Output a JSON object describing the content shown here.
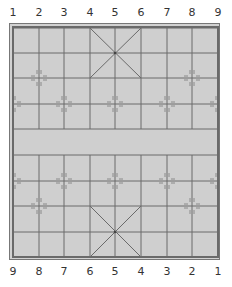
{
  "board": {
    "type": "xiangqi",
    "columns": 9,
    "rows": 10,
    "top_file_labels": [
      "1",
      "2",
      "3",
      "4",
      "5",
      "6",
      "7",
      "8",
      "9"
    ],
    "bottom_file_labels": [
      "9",
      "8",
      "7",
      "6",
      "5",
      "4",
      "3",
      "2",
      "1"
    ],
    "colors": {
      "board": "#cfcfcf",
      "grid_line": "#6a6a6a",
      "border": "#6a6a6a",
      "label": "#333333"
    },
    "palaces": [
      {
        "name": "top-palace",
        "cols": [
          3,
          5
        ],
        "rows": [
          0,
          2
        ]
      },
      {
        "name": "bottom-palace",
        "cols": [
          3,
          5
        ],
        "rows": [
          7,
          9
        ]
      }
    ],
    "position_markers": [
      {
        "col": 1,
        "row": 2
      },
      {
        "col": 7,
        "row": 2
      },
      {
        "col": 0,
        "row": 3
      },
      {
        "col": 2,
        "row": 3
      },
      {
        "col": 4,
        "row": 3
      },
      {
        "col": 6,
        "row": 3
      },
      {
        "col": 8,
        "row": 3
      },
      {
        "col": 0,
        "row": 6
      },
      {
        "col": 2,
        "row": 6
      },
      {
        "col": 4,
        "row": 6
      },
      {
        "col": 6,
        "row": 6
      },
      {
        "col": 8,
        "row": 6
      },
      {
        "col": 1,
        "row": 7
      },
      {
        "col": 7,
        "row": 7
      }
    ],
    "pieces": []
  }
}
